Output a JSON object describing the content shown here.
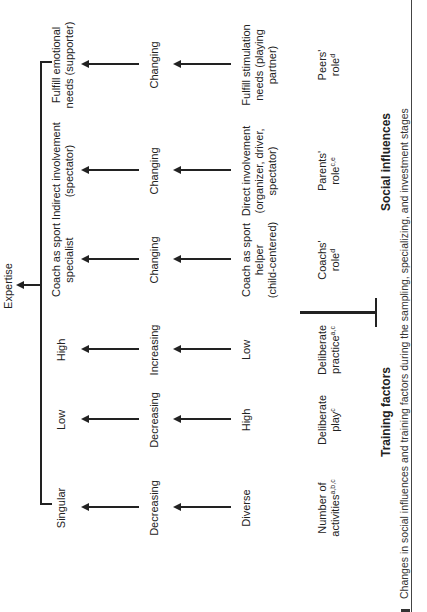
{
  "top": {
    "expertise": "Expertise"
  },
  "columns": [
    {
      "id": "activities",
      "label": "Number of",
      "label2": "activities",
      "sup": "a,b,c",
      "level1": "Diverse",
      "level2": "Decreasing",
      "level3": "Singular"
    },
    {
      "id": "play",
      "label": "Deliberate",
      "label2": "play",
      "sup": "c",
      "level1": "High",
      "level2": "Decreasing",
      "level3": "Low"
    },
    {
      "id": "practice",
      "label": "Deliberate",
      "label2": "practice",
      "sup": "a,c",
      "level1": "Low",
      "level2": "Increasing",
      "level3": "High"
    },
    {
      "id": "coach",
      "label": "Coachs'",
      "label2": "role",
      "sup": "d",
      "level1a": "Coach as sport",
      "level1b": "helper",
      "level1c": "(child-centered)",
      "level2": "Changing",
      "level3a": "Coach as sport",
      "level3b": "specialist"
    },
    {
      "id": "parents",
      "label": "Parents'",
      "label2": "role",
      "sup": "c,e",
      "level1a": "Direct involvement",
      "level1b": "(organizer, driver,",
      "level1c": "spectator)",
      "level2": "Changing",
      "level3a": "Indirect involvement",
      "level3b": "(spectator)"
    },
    {
      "id": "peers",
      "label": "Peers'",
      "label2": "role",
      "sup": "d",
      "level1a": "Fulfill stimulation",
      "level1b": "needs (playing",
      "level1c": "partner)",
      "level2": "Changing",
      "level3a": "Fulfill emotional",
      "level3b": "needs (supporter)"
    }
  ],
  "groups": {
    "training": "Training factors",
    "social": "Social influences"
  },
  "caption": "Changes in social influences and training factors during the sampling, specializing, and investment stages"
}
